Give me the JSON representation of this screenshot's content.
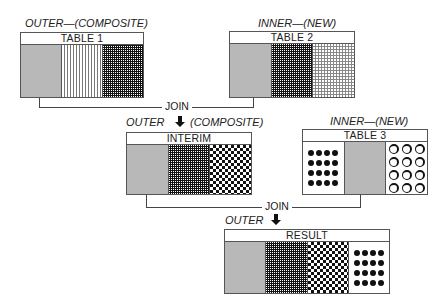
{
  "diagram": {
    "table1": {
      "role_label": "OUTER—(COMPOSITE)",
      "title": "TABLE 1",
      "columns": [
        "gray",
        "vertical-lines",
        "dense-grid"
      ]
    },
    "table2": {
      "role_label": "INNER—(NEW)",
      "title": "TABLE 2",
      "columns": [
        "gray",
        "dense-grid",
        "fine-grid"
      ]
    },
    "join1": {
      "label": "JOIN"
    },
    "interim": {
      "role_label_left": "OUTER",
      "role_label_right": "(COMPOSITE)",
      "title": "INTERIM",
      "columns": [
        "gray",
        "dense-grid",
        "checker"
      ]
    },
    "table3": {
      "role_label": "INNER—(NEW)",
      "title": "TABLE 3",
      "columns": [
        "dots",
        "gray",
        "circles"
      ]
    },
    "join2": {
      "label": "JOIN"
    },
    "result": {
      "role_label": "OUTER",
      "title": "RESULT",
      "columns": [
        "gray",
        "dense-grid",
        "checker",
        "dots"
      ]
    },
    "arrow_icon": "down-arrow-icon"
  }
}
